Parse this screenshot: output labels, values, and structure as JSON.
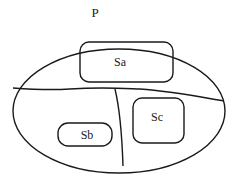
{
  "diagram": {
    "type": "set-partition",
    "outer_set": {
      "label": "P",
      "shape": "ellipse"
    },
    "subsets": [
      {
        "id": "Sa",
        "label": "Sa",
        "region": "upper"
      },
      {
        "id": "Sb",
        "label": "Sb",
        "region": "lower-left"
      },
      {
        "id": "Sc",
        "label": "Sc",
        "region": "lower-right"
      }
    ],
    "partition_lines": [
      {
        "name": "horizontal-divider",
        "description": "splits P into upper and lower regions"
      },
      {
        "name": "vertical-divider",
        "description": "splits lower region into left and right parts"
      }
    ],
    "colors": {
      "line": "#1a1a1a",
      "background": "#ffffff"
    }
  }
}
